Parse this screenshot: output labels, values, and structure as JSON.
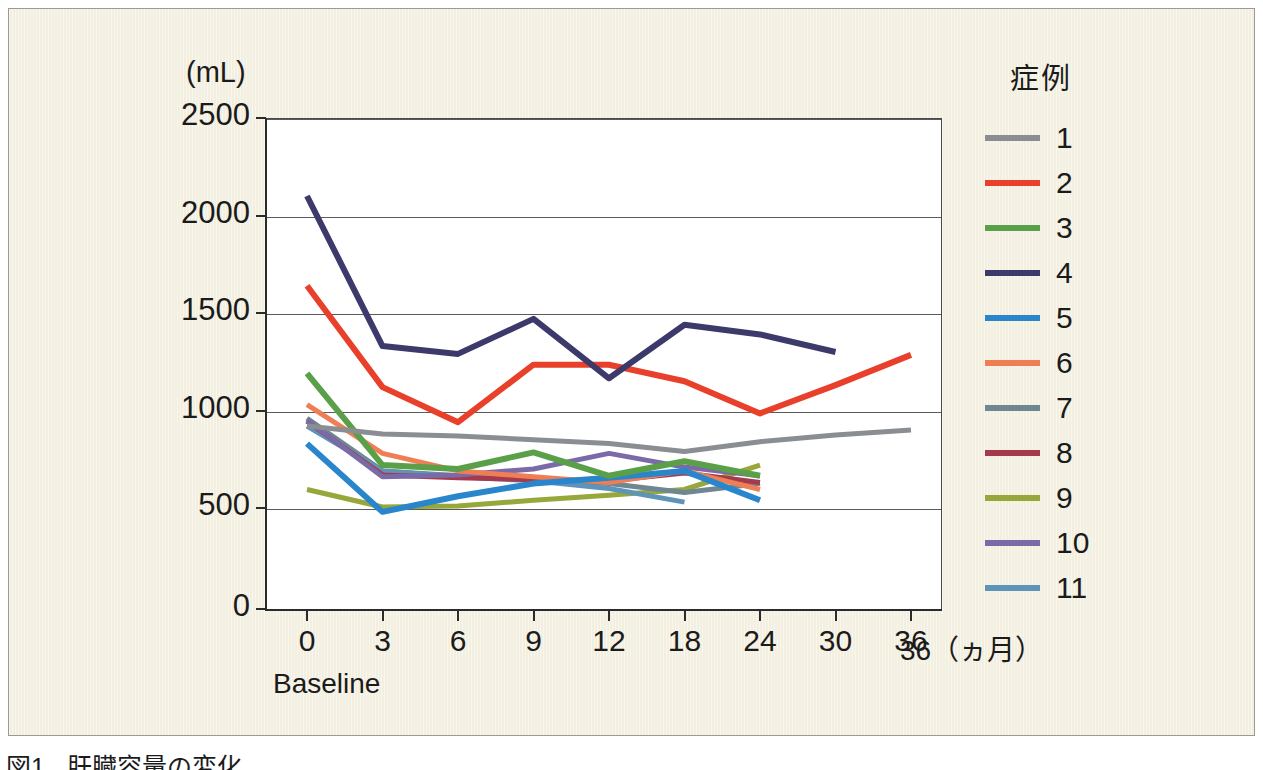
{
  "figure": {
    "caption_number": "図1",
    "caption_text": "肝臓容量の変化",
    "unit_label": "(mL)",
    "x_unit_label": "36（ヵ月）",
    "baseline_label": "Baseline"
  },
  "legend": {
    "title": "症例",
    "items": [
      {
        "label": "1",
        "color": "#8a8e92"
      },
      {
        "label": "2",
        "color": "#e8402a"
      },
      {
        "label": "3",
        "color": "#5aa049"
      },
      {
        "label": "4",
        "color": "#3b3a6b"
      },
      {
        "label": "5",
        "color": "#2a86cc"
      },
      {
        "label": "6",
        "color": "#ef7e55"
      },
      {
        "label": "7",
        "color": "#6e8793"
      },
      {
        "label": "8",
        "color": "#a63a4d"
      },
      {
        "label": "9",
        "color": "#97a73a"
      },
      {
        "label": "10",
        "color": "#7a6aa8"
      },
      {
        "label": "11",
        "color": "#5e94b8"
      }
    ]
  },
  "chart_data": {
    "type": "line",
    "title": "肝臓容量の変化",
    "xlabel": "（ヵ月）",
    "ylabel": "(mL)",
    "categories": [
      "0",
      "3",
      "6",
      "9",
      "12",
      "18",
      "24",
      "30",
      "36"
    ],
    "x_tick_labels": [
      "0",
      "3",
      "6",
      "9",
      "12",
      "18",
      "24",
      "30",
      "36"
    ],
    "y_tick_labels": [
      "0",
      "500",
      "1000",
      "1500",
      "2000",
      "2500"
    ],
    "y_ticks": [
      0,
      500,
      1000,
      1500,
      2000,
      2500
    ],
    "ylim": [
      0,
      2500
    ],
    "grid": "horizontal",
    "legend_position": "right",
    "series": [
      {
        "name": "1",
        "color": "#8a8e92",
        "values": [
          920,
          880,
          870,
          850,
          830,
          790,
          840,
          875,
          900
        ]
      },
      {
        "name": "2",
        "color": "#e8402a",
        "values": [
          1640,
          1120,
          940,
          1235,
          1235,
          1150,
          985,
          1130,
          1285
        ]
      },
      {
        "name": "3",
        "color": "#5aa049",
        "values": [
          1190,
          720,
          700,
          785,
          665,
          740,
          665,
          null,
          null
        ]
      },
      {
        "name": "4",
        "color": "#3b3a6b",
        "values": [
          2100,
          1330,
          1290,
          1470,
          1165,
          1440,
          1390,
          1300,
          null
        ]
      },
      {
        "name": "5",
        "color": "#2a86cc",
        "values": [
          830,
          480,
          560,
          625,
          655,
          690,
          540,
          null,
          null
        ]
      },
      {
        "name": "6",
        "color": "#ef7e55",
        "values": [
          1030,
          780,
          690,
          660,
          630,
          690,
          595,
          null,
          null
        ]
      },
      {
        "name": "7",
        "color": "#6e8793",
        "values": [
          960,
          690,
          665,
          645,
          625,
          580,
          625,
          null,
          null
        ]
      },
      {
        "name": "8",
        "color": "#a63a4d",
        "values": [
          945,
          670,
          655,
          645,
          640,
          680,
          630,
          null,
          null
        ]
      },
      {
        "name": "9",
        "color": "#97a73a",
        "values": [
          595,
          505,
          510,
          540,
          565,
          595,
          720,
          null,
          null
        ]
      },
      {
        "name": "10",
        "color": "#7a6aa8",
        "values": [
          950,
          660,
          670,
          700,
          780,
          710,
          665,
          null,
          null
        ]
      },
      {
        "name": "11",
        "color": "#5e94b8",
        "values": [
          920,
          690,
          660,
          640,
          600,
          530,
          null,
          null,
          null
        ]
      }
    ]
  }
}
